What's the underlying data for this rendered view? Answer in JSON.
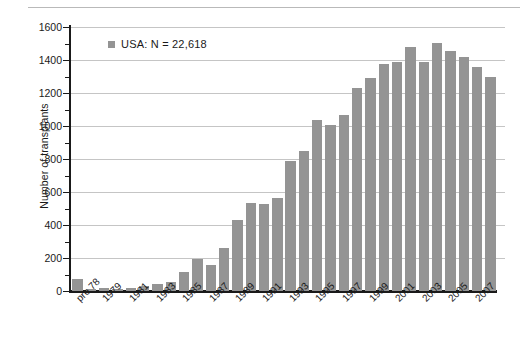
{
  "chart_data": {
    "type": "bar",
    "title": "",
    "subtitle": "",
    "xlabel": "",
    "ylabel": "Number of transplants",
    "ylim": [
      0,
      1600
    ],
    "ytick_step": 200,
    "yminor_step": 100,
    "grid": true,
    "legend_position": "top-left",
    "legend": [
      {
        "name": "USA:  N = 22,618",
        "color": "#949494"
      }
    ],
    "bar_color": "#949494",
    "categories": [
      "pre 78",
      "1978",
      "1979",
      "1980",
      "1981",
      "1982",
      "1983",
      "1984",
      "1985",
      "1986",
      "1987",
      "1988",
      "1989",
      "1990",
      "1991",
      "1992",
      "1993",
      "1994",
      "1995",
      "1996",
      "1997",
      "1998",
      "1999",
      "2000",
      "2001",
      "2002",
      "2003",
      "2004",
      "2005",
      "2006",
      "2007",
      "2008"
    ],
    "tick_labels": [
      "pre 78",
      "",
      "1979",
      "",
      "1981",
      "",
      "1983",
      "",
      "1985",
      "",
      "1987",
      "",
      "1989",
      "",
      "1991",
      "",
      "1993",
      "",
      "1995",
      "",
      "1997",
      "",
      "1999",
      "",
      "2001",
      "",
      "2003",
      "",
      "2005",
      "",
      "2007",
      ""
    ],
    "series": [
      {
        "name": "USA",
        "values": [
          72,
          12,
          16,
          14,
          20,
          30,
          40,
          55,
          115,
          195,
          160,
          260,
          430,
          535,
          530,
          565,
          790,
          850,
          1035,
          1005,
          1065,
          1230,
          1290,
          1375,
          1385,
          1480,
          1390,
          1505,
          1455,
          1420,
          1355,
          1295
        ]
      }
    ],
    "ytick_labels": [
      "0",
      "200",
      "400",
      "600",
      "800",
      "1000",
      "1200",
      "1400",
      "1600"
    ],
    "axis_color": "#1a1a1a",
    "gridline_color": "#c5c5c5"
  },
  "legend": {
    "entry_label": "USA:  N = 22,618"
  },
  "axes": {
    "y_title": "Number of transplants"
  }
}
